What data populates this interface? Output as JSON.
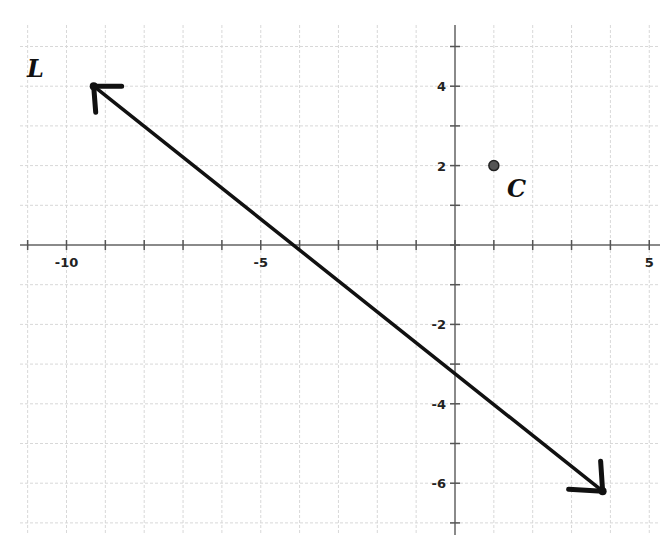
{
  "chart_data": {
    "type": "line",
    "title": "",
    "xlabel": "",
    "ylabel": "",
    "xlim": [
      -11,
      5
    ],
    "ylim": [
      -7,
      5
    ],
    "grid": true,
    "x_tick_labels": [
      {
        "value": -10,
        "label": "-10"
      },
      {
        "value": -5,
        "label": "-5"
      },
      {
        "value": 5,
        "label": "5"
      }
    ],
    "y_tick_labels": [
      {
        "value": 4,
        "label": "4"
      },
      {
        "value": 2,
        "label": "2"
      },
      {
        "value": -2,
        "label": "-2"
      },
      {
        "value": -4,
        "label": "-4"
      },
      {
        "value": -6,
        "label": "-6"
      }
    ],
    "series": [
      {
        "name": "L",
        "kind": "line-with-arrows",
        "points": [
          [
            -9.3,
            4.0
          ],
          [
            3.8,
            -6.2
          ]
        ],
        "x_intercept": -4.3,
        "y_intercept": -3.2
      },
      {
        "name": "C",
        "kind": "point",
        "points": [
          [
            1,
            2
          ]
        ]
      }
    ],
    "labels": {
      "line": "L",
      "point": "C"
    }
  }
}
